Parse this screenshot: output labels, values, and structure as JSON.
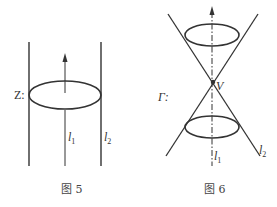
{
  "figures": [
    {
      "caption": "图 5",
      "surface_label": "Z:",
      "axis_label": "l",
      "axis_sub": "1",
      "generator_label": "l",
      "generator_sub": "2"
    },
    {
      "caption": "图 6",
      "surface_label": "Γ:",
      "vertex_label": "V",
      "axis_label": "l",
      "axis_sub": "1",
      "generator_label": "l",
      "generator_sub": "2"
    }
  ]
}
